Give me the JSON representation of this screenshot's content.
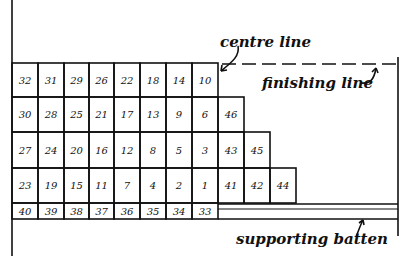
{
  "diagram": {
    "title": "",
    "labels": {
      "centre_line": "centre line",
      "finishing_line": "finishing line",
      "supporting_batten": "supporting batten"
    },
    "colors": {
      "ink": "#111111",
      "background": "#ffffff"
    },
    "tiles": {
      "row1": [
        "32",
        "31",
        "29",
        "26",
        "22",
        "18",
        "14",
        "10"
      ],
      "row2": [
        "30",
        "28",
        "25",
        "21",
        "17",
        "13",
        "9",
        "6",
        "46"
      ],
      "row3": [
        "27",
        "24",
        "20",
        "16",
        "12",
        "8",
        "5",
        "3",
        "43",
        "45"
      ],
      "row4": [
        "23",
        "19",
        "15",
        "11",
        "7",
        "4",
        "2",
        "1",
        "41",
        "42",
        "44"
      ],
      "row5": [
        "40",
        "39",
        "38",
        "37",
        "36",
        "35",
        "34",
        "33"
      ]
    }
  }
}
